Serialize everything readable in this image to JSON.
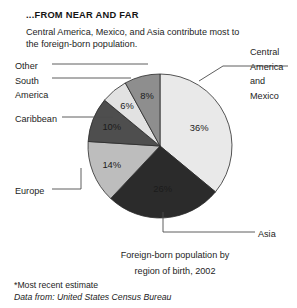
{
  "header": {
    "title": "...FROM NEAR AND FAR",
    "subtitle": "Central America, Mexico, and Asia contribute most to the foreign-born population."
  },
  "caption": {
    "line1": "Foreign-born population by",
    "line2": "region of birth, 2002"
  },
  "footnotes": {
    "estimate": "*Most recent estimate",
    "source": "Data from: United States Census Bureau"
  },
  "callouts": {
    "central_line1": "Central",
    "central_line2": "America",
    "central_line3": "and",
    "central_line4": "Mexico",
    "other": "Other",
    "south_line1": "South",
    "south_line2": "America",
    "caribbean": "Caribbean",
    "europe": "Europe",
    "asia": "Asia"
  },
  "chart_data": {
    "type": "pie",
    "title": "...FROM NEAR AND FAR",
    "subtitle": "Central America, Mexico, and Asia contribute most to the foreign-born population.",
    "caption": "Foreign-born population by region of birth, 2002",
    "source": "Data from: United States Census Bureau",
    "note": "*Most recent estimate",
    "unit": "percent",
    "legend_position": "callout-labels",
    "grid": false,
    "start_angle_deg": 0,
    "direction": "clockwise",
    "center": [
      160,
      146
    ],
    "radius": 72,
    "categories": [
      "Central America and Mexico",
      "Asia",
      "Europe",
      "Caribbean",
      "South America",
      "Other"
    ],
    "values": [
      36,
      26,
      14,
      10,
      6,
      8
    ],
    "labels": [
      "36%",
      "26%",
      "14%",
      "10%",
      "6%",
      "8%"
    ],
    "colors": [
      "#e9e9e9",
      "#2b2b2b",
      "#bdbdbd",
      "#4e4e4e",
      "#e2e2e2",
      "#8e8e8e"
    ],
    "label_text_colors": [
      "#1b1b1b",
      "#f2f2f2",
      "#1b1b1b",
      "#f2f2f2",
      "#1b1b1b",
      "#1b1b1b"
    ],
    "slices": [
      {
        "name": "Central America and Mexico",
        "value": 36,
        "label": "36%",
        "color": "#e9e9e9"
      },
      {
        "name": "Asia",
        "value": 26,
        "label": "26%",
        "color": "#2b2b2b"
      },
      {
        "name": "Europe",
        "value": 14,
        "label": "14%",
        "color": "#bdbdbd"
      },
      {
        "name": "Caribbean",
        "value": 10,
        "label": "10%",
        "color": "#4e4e4e"
      },
      {
        "name": "South America",
        "value": 6,
        "label": "6%",
        "color": "#e2e2e2"
      },
      {
        "name": "Other",
        "value": 8,
        "label": "8%",
        "color": "#8e8e8e"
      }
    ]
  }
}
